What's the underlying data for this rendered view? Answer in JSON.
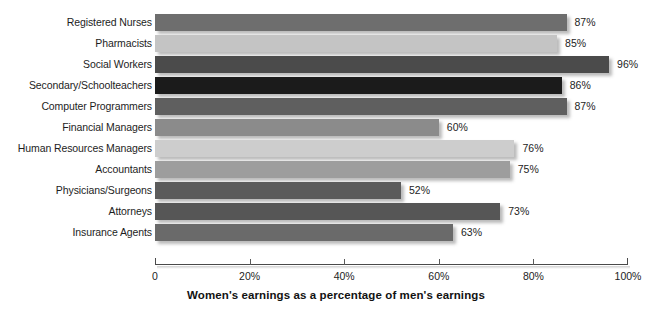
{
  "chart_data": {
    "type": "bar",
    "orientation": "horizontal",
    "title": "",
    "xlabel": "Women's earnings as a percentage of men's earnings",
    "ylabel": "",
    "xlim": [
      0,
      100
    ],
    "grid": false,
    "legend": null,
    "categories": [
      "Registered Nurses",
      "Pharmacists",
      "Social Workers",
      "Secondary/Schoolteachers",
      "Computer Programmers",
      "Financial Managers",
      "Human Resources Managers",
      "Accountants",
      "Physicians/Surgeons",
      "Attorneys",
      "Insurance Agents"
    ],
    "values": [
      87,
      85,
      96,
      86,
      87,
      60,
      76,
      75,
      52,
      73,
      63
    ],
    "value_labels": [
      "87%",
      "85%",
      "96%",
      "86%",
      "87%",
      "60%",
      "76%",
      "75%",
      "52%",
      "73%",
      "63%"
    ],
    "bar_colors": [
      "#6e6e6e",
      "#c4c4c4",
      "#4b4b4b",
      "#1b1b1b",
      "#5f5f5f",
      "#8b8b8b",
      "#cdcdcd",
      "#9d9d9d",
      "#5b5b5b",
      "#565656",
      "#6a6a6a"
    ],
    "xticks": [
      0,
      20,
      40,
      60,
      80,
      100
    ],
    "xtick_labels": [
      "0",
      "20%",
      "40%",
      "60%",
      "80%",
      "100%"
    ]
  }
}
